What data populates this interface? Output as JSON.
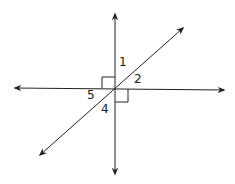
{
  "diagram": {
    "type": "intersecting-lines",
    "lines": [
      "vertical",
      "horizontal",
      "diagonal"
    ],
    "right_angle_marks": 2,
    "angle_labels": [
      {
        "id": "1",
        "text": "1",
        "x": 119,
        "y": 58
      },
      {
        "id": "2",
        "text": "2",
        "x": 134,
        "y": 75
      },
      {
        "id": "5",
        "text": "5",
        "x": 87,
        "y": 90
      },
      {
        "id": "4",
        "text": "4",
        "x": 101,
        "y": 104
      }
    ],
    "stroke_color": "#222222"
  }
}
